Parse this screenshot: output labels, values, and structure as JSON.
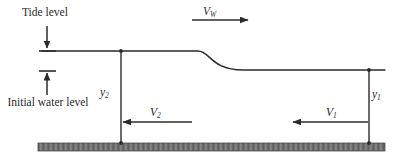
{
  "figure": {
    "width": 408,
    "height": 162,
    "background_color": "#ffffff",
    "line_color": "#2b2b2b",
    "bed_color": "#6e6e6e"
  },
  "labels": {
    "tide_level": "Tide level",
    "initial_water_level": "Initial water level"
  },
  "symbols": {
    "wave_speed": {
      "base": "V",
      "sub": "W"
    },
    "velocity_2": {
      "base": "V",
      "sub": "2"
    },
    "velocity_1": {
      "base": "V",
      "sub": "1"
    },
    "depth_2": {
      "base": "y",
      "sub": "2"
    },
    "depth_1": {
      "base": "y",
      "sub": "1"
    }
  },
  "geometry": {
    "surface_upstream_y": 51,
    "surface_downstream_y": 70,
    "bed_top_y": 143,
    "bed_bottom_y": 151,
    "bed_left_x": 38,
    "bed_right_x": 385,
    "surface_left_x": 42,
    "surface_right_x": 385,
    "bore_start_x": 198,
    "bore_end_x": 243,
    "depth2_station_x": 121,
    "depth1_station_x": 369,
    "wave_arrow": {
      "x1": 192,
      "x2": 249,
      "y": 20,
      "direction": "right"
    },
    "v2_arrow": {
      "x1": 192,
      "x2": 122,
      "y": 122,
      "direction": "left"
    },
    "v1_arrow": {
      "x1": 368,
      "x2": 292,
      "y": 122,
      "direction": "left"
    },
    "tide_arrow": {
      "x": 47,
      "y1": 26,
      "y2": 49,
      "direction": "down"
    },
    "initial_level_arrow": {
      "x": 47,
      "y1": 95,
      "y2": 71,
      "direction": "up"
    }
  }
}
